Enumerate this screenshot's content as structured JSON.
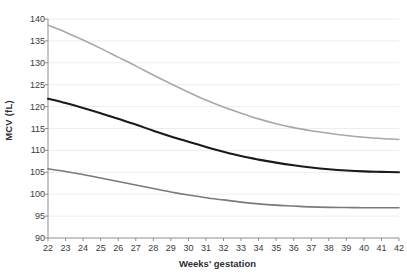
{
  "chart_data": {
    "type": "line",
    "title": "",
    "subtitle": "",
    "xlabel": "Weeks' gestation",
    "ylabel": "MCV (fL)",
    "xlim": [
      22,
      42
    ],
    "ylim": [
      90,
      140
    ],
    "xticks": [
      22,
      23,
      24,
      25,
      26,
      27,
      28,
      29,
      30,
      31,
      32,
      33,
      34,
      35,
      36,
      37,
      38,
      39,
      40,
      41,
      42
    ],
    "yticks": [
      90,
      95,
      100,
      105,
      110,
      115,
      120,
      125,
      130,
      135,
      140
    ],
    "grid": "horizontal",
    "legend_position": "none",
    "x": [
      22,
      23,
      24,
      25,
      26,
      27,
      28,
      29,
      30,
      31,
      32,
      33,
      34,
      35,
      36,
      37,
      38,
      39,
      40,
      41,
      42
    ],
    "series": [
      {
        "name": "upper-reference-limit",
        "color": "#a8a8a8",
        "width": 1.6,
        "values": [
          138.6,
          137.0,
          135.2,
          133.3,
          131.3,
          129.3,
          127.2,
          125.2,
          123.3,
          121.5,
          119.9,
          118.5,
          117.2,
          116.1,
          115.2,
          114.5,
          113.9,
          113.4,
          113.0,
          112.7,
          112.5
        ]
      },
      {
        "name": "median",
        "color": "#1a1a1a",
        "width": 2.1,
        "values": [
          121.8,
          120.8,
          119.7,
          118.5,
          117.2,
          115.9,
          114.5,
          113.2,
          112.0,
          110.8,
          109.7,
          108.7,
          107.9,
          107.2,
          106.6,
          106.1,
          105.7,
          105.4,
          105.2,
          105.1,
          105.0
        ]
      },
      {
        "name": "lower-reference-limit",
        "color": "#7a7a7a",
        "width": 1.6,
        "values": [
          105.8,
          105.2,
          104.5,
          103.7,
          102.9,
          102.1,
          101.3,
          100.5,
          99.8,
          99.2,
          98.7,
          98.2,
          97.8,
          97.5,
          97.3,
          97.1,
          97.0,
          96.95,
          96.9,
          96.9,
          96.9
        ]
      }
    ]
  },
  "axis": {
    "ylabel_text": "MCV (fL)",
    "xlabel_text": "Weeks' gestation"
  },
  "colors": {
    "background": "#ffffff",
    "grid": "#e9eef2",
    "axis": "#8f8f8f",
    "tick_text": "#3a3a3a",
    "series_upper": "#a8a8a8",
    "series_median": "#1a1a1a",
    "series_lower": "#7a7a7a"
  }
}
